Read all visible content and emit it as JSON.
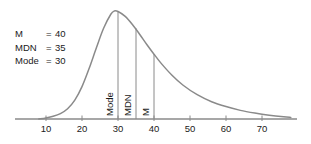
{
  "chart_data": {
    "type": "line",
    "title": "",
    "subtitle": "",
    "xlabel": "",
    "ylabel": "",
    "grid": false,
    "legend_position": "upper-left-inside",
    "xlim": [
      0,
      78
    ],
    "ylim": [
      0,
      1
    ],
    "x_ticks": [
      10,
      20,
      30,
      40,
      50,
      60,
      70
    ],
    "x_tick_labels": [
      "10",
      "20",
      "30",
      "40",
      "50",
      "60",
      "70"
    ],
    "series": [
      {
        "name": "positively-skewed-distribution",
        "color": "#8a8a8a",
        "x": [
          8,
          10,
          12,
          14,
          16,
          18,
          20,
          22,
          24,
          26,
          28,
          29,
          30,
          32,
          34,
          36,
          38,
          40,
          42,
          45,
          48,
          52,
          56,
          60,
          64,
          68,
          72,
          76,
          78
        ],
        "y": [
          0.0,
          0.01,
          0.025,
          0.05,
          0.095,
          0.175,
          0.3,
          0.47,
          0.66,
          0.84,
          0.97,
          1.0,
          0.995,
          0.95,
          0.875,
          0.785,
          0.69,
          0.6,
          0.515,
          0.405,
          0.315,
          0.225,
          0.16,
          0.115,
          0.08,
          0.055,
          0.035,
          0.02,
          0.015
        ]
      }
    ],
    "reference_lines": [
      {
        "name": "mode",
        "label": "Mode",
        "x": 30,
        "value": 30,
        "height": 1.0,
        "color": "#8a8a8a"
      },
      {
        "name": "mdn",
        "label": "MDN",
        "x": 35,
        "value": 35,
        "height": 0.84,
        "color": "#8a8a8a"
      },
      {
        "name": "m",
        "label": "M",
        "x": 40,
        "value": 40,
        "height": 0.6,
        "color": "#8a8a8a"
      }
    ],
    "annotations": [
      {
        "label": "M",
        "equals": "=",
        "value": "40"
      },
      {
        "label": "MDN",
        "equals": "=",
        "value": "35"
      },
      {
        "label": "Mode",
        "equals": "=",
        "value": "30"
      }
    ]
  },
  "legend": {
    "rows": [
      {
        "label": "M",
        "eq": "=",
        "value": "40"
      },
      {
        "label": "MDN",
        "eq": "=",
        "value": "35"
      },
      {
        "label": "Mode",
        "eq": "=",
        "value": "30"
      }
    ]
  },
  "axis": {
    "ticks": [
      {
        "label": "10",
        "value": 10
      },
      {
        "label": "20",
        "value": 20
      },
      {
        "label": "30",
        "value": 30
      },
      {
        "label": "40",
        "value": 40
      },
      {
        "label": "50",
        "value": 50
      },
      {
        "label": "60",
        "value": 60
      },
      {
        "label": "70",
        "value": 70
      }
    ]
  },
  "vertical_labels": [
    {
      "text": "Mode"
    },
    {
      "text": "MDN"
    },
    {
      "text": "M"
    }
  ],
  "colors": {
    "curve": "#8a8a8a",
    "axis": "#8a8a8a",
    "reference_line": "#8a8a8a",
    "text": "#1a1a1a",
    "background": "#ffffff"
  }
}
